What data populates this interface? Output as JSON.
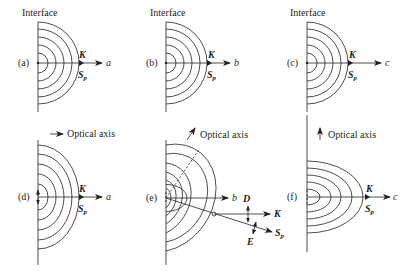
{
  "figure": {
    "interface_label": "Interface",
    "optical_axis_label": "Optical axis",
    "colors": {
      "ink": "#231f20",
      "background": "#ffffff"
    },
    "panels": [
      {
        "id": "a",
        "label": "(a)",
        "axis": "a",
        "k": "K",
        "s": "S",
        "s_sub": "p",
        "shape": "circle"
      },
      {
        "id": "b",
        "label": "(b)",
        "axis": "b",
        "k": "K",
        "s": "S",
        "s_sub": "p",
        "shape": "circle"
      },
      {
        "id": "c",
        "label": "(c)",
        "axis": "c",
        "k": "K",
        "s": "S",
        "s_sub": "p",
        "shape": "circle"
      },
      {
        "id": "d",
        "label": "(d)",
        "axis": "a",
        "k": "K",
        "s": "S",
        "s_sub": "p",
        "shape": "vertical-ellipse"
      },
      {
        "id": "e",
        "label": "(e)",
        "axis": "b",
        "k": "K",
        "s": "S",
        "s_sub": "p",
        "d": "D",
        "e": "E",
        "shape": "tilted-ellipse"
      },
      {
        "id": "f",
        "label": "(f)",
        "axis": "c",
        "k": "K",
        "s": "S",
        "s_sub": "p",
        "shape": "horizontal-ellipse"
      }
    ],
    "optical_axis_directions": [
      {
        "column": 1,
        "direction": "horizontal-right"
      },
      {
        "column": 2,
        "direction": "diagonal-up-right"
      },
      {
        "column": 3,
        "direction": "vertical-up"
      }
    ]
  }
}
